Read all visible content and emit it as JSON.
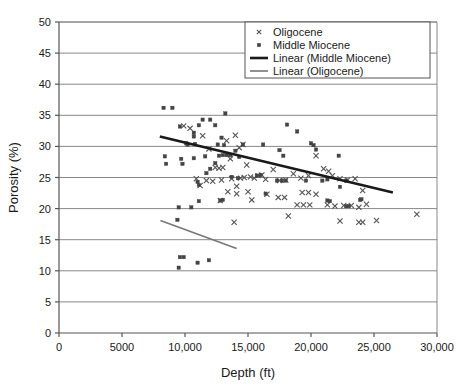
{
  "chart_data": {
    "type": "scatter",
    "title": "",
    "xlabel": "Depth (ft)",
    "ylabel": "Porosity (%)",
    "xlim": [
      0,
      30000
    ],
    "ylim": [
      0,
      50
    ],
    "xticks": [
      0,
      5000,
      10000,
      15000,
      20000,
      25000,
      30000
    ],
    "xtick_labels": [
      "0",
      "5000",
      "10,000",
      "15,000",
      "20,000",
      "25,000",
      "30,000"
    ],
    "yticks": [
      0,
      5,
      10,
      15,
      20,
      25,
      30,
      35,
      40,
      45,
      50
    ],
    "ytick_labels": [
      "0",
      "5",
      "10",
      "15",
      "20",
      "25",
      "30",
      "35",
      "40",
      "45",
      "50"
    ],
    "grid": "horizontal",
    "legend_position": "top-right",
    "series": [
      {
        "name": "Oligocene",
        "marker": "x",
        "color": "#555555",
        "points": [
          [
            9900,
            33.3
          ],
          [
            10400,
            32.9
          ],
          [
            11400,
            31.7
          ],
          [
            11900,
            29.6
          ],
          [
            12400,
            26.6
          ],
          [
            12700,
            26.5
          ],
          [
            13000,
            26.6
          ],
          [
            13300,
            30.9
          ],
          [
            13600,
            28.0
          ],
          [
            14000,
            31.8
          ],
          [
            14300,
            29.8
          ],
          [
            14600,
            30.3
          ],
          [
            14900,
            27.0
          ],
          [
            15200,
            25.1
          ],
          [
            15500,
            24.9
          ],
          [
            15800,
            25.3
          ],
          [
            16100,
            25.4
          ],
          [
            16400,
            24.7
          ],
          [
            13700,
            24.8
          ],
          [
            12900,
            24.6
          ],
          [
            12200,
            24.4
          ],
          [
            11700,
            24.5
          ],
          [
            11200,
            23.7
          ],
          [
            10900,
            24.8
          ],
          [
            14100,
            23.6
          ],
          [
            14400,
            24.9
          ],
          [
            14700,
            25.0
          ],
          [
            15000,
            22.7
          ],
          [
            17000,
            26.3
          ],
          [
            17500,
            24.5
          ],
          [
            18000,
            24.6
          ],
          [
            18600,
            25.6
          ],
          [
            19200,
            24.9
          ],
          [
            19800,
            25.3
          ],
          [
            20400,
            28.5
          ],
          [
            21000,
            26.4
          ],
          [
            21400,
            26.0
          ],
          [
            21700,
            25.3
          ],
          [
            22300,
            24.8
          ],
          [
            22900,
            24.6
          ],
          [
            23500,
            24.8
          ],
          [
            24100,
            22.9
          ],
          [
            17400,
            21.8
          ],
          [
            17900,
            21.8
          ],
          [
            18900,
            20.6
          ],
          [
            19400,
            20.6
          ],
          [
            19900,
            20.6
          ],
          [
            21300,
            20.6
          ],
          [
            21900,
            20.4
          ],
          [
            22600,
            20.5
          ],
          [
            23200,
            20.5
          ],
          [
            23800,
            20.2
          ],
          [
            24400,
            20.7
          ],
          [
            18200,
            18.8
          ],
          [
            22300,
            18.0
          ],
          [
            23800,
            17.8
          ],
          [
            24100,
            17.8
          ],
          [
            25200,
            18.1
          ],
          [
            28400,
            19.1
          ],
          [
            13900,
            17.8
          ],
          [
            19300,
            22.6
          ],
          [
            19800,
            22.6
          ],
          [
            20400,
            22.3
          ],
          [
            13400,
            22.7
          ],
          [
            14100,
            22.4
          ],
          [
            15300,
            21.4
          ],
          [
            16500,
            22.3
          ],
          [
            12800,
            21.3
          ]
        ]
      },
      {
        "name": "Middle Miocene",
        "marker": "square",
        "color": "#444444",
        "points": [
          [
            8300,
            36.2
          ],
          [
            9000,
            36.2
          ],
          [
            13200,
            35.3
          ],
          [
            11400,
            34.3
          ],
          [
            12000,
            34.3
          ],
          [
            12400,
            33.4
          ],
          [
            11100,
            33.4
          ],
          [
            9600,
            33.2
          ],
          [
            10700,
            32.2
          ],
          [
            10700,
            31.6
          ],
          [
            12900,
            31.4
          ],
          [
            10100,
            30.5
          ],
          [
            10200,
            30.3
          ],
          [
            10800,
            30.4
          ],
          [
            12600,
            30.3
          ],
          [
            13100,
            30.2
          ],
          [
            14600,
            30.3
          ],
          [
            16200,
            30.3
          ],
          [
            20000,
            30.5
          ],
          [
            20200,
            30.2
          ],
          [
            20400,
            29.5
          ],
          [
            17500,
            29.4
          ],
          [
            18900,
            32.4
          ],
          [
            18100,
            33.5
          ],
          [
            8400,
            28.4
          ],
          [
            8500,
            27.2
          ],
          [
            9800,
            27.2
          ],
          [
            9700,
            28.0
          ],
          [
            10700,
            28.1
          ],
          [
            11600,
            28.4
          ],
          [
            12400,
            27.3
          ],
          [
            12700,
            28.5
          ],
          [
            13000,
            28.6
          ],
          [
            13300,
            28.6
          ],
          [
            13600,
            28.6
          ],
          [
            14000,
            29.3
          ],
          [
            14300,
            28.3
          ],
          [
            17800,
            28.5
          ],
          [
            22200,
            28.5
          ],
          [
            11000,
            24.3
          ],
          [
            11100,
            23.8
          ],
          [
            11700,
            25.7
          ],
          [
            12000,
            26.4
          ],
          [
            13700,
            25.1
          ],
          [
            14200,
            24.9
          ],
          [
            15700,
            25.3
          ],
          [
            16000,
            25.4
          ],
          [
            17300,
            24.5
          ],
          [
            17700,
            24.5
          ],
          [
            18000,
            24.5
          ],
          [
            19600,
            24.5
          ],
          [
            20900,
            24.5
          ],
          [
            21300,
            24.7
          ],
          [
            22300,
            23.5
          ],
          [
            22800,
            24.5
          ],
          [
            12800,
            21.3
          ],
          [
            13000,
            21.4
          ],
          [
            16400,
            22.4
          ],
          [
            21300,
            21.3
          ],
          [
            21500,
            21.2
          ],
          [
            22800,
            20.4
          ],
          [
            23000,
            20.4
          ],
          [
            23900,
            21.4
          ],
          [
            24000,
            21.5
          ],
          [
            9500,
            20.2
          ],
          [
            10500,
            20.2
          ],
          [
            11100,
            21.2
          ],
          [
            9400,
            18.2
          ],
          [
            9600,
            12.2
          ],
          [
            9900,
            12.2
          ],
          [
            9500,
            10.5
          ],
          [
            11000,
            11.3
          ],
          [
            11900,
            11.7
          ]
        ]
      }
    ],
    "trendlines": [
      {
        "name": "Linear (Middle Miocene)",
        "color": "#1a1a1a",
        "width": 2.6,
        "x0": 8000,
        "y0": 31.6,
        "x1": 26500,
        "y1": 22.6
      },
      {
        "name": "Linear (Oligocene)",
        "color": "#777777",
        "width": 1.6,
        "x0": 8050,
        "y0": 18.1,
        "x1": 14100,
        "y1": 13.6
      }
    ],
    "legend": [
      {
        "label": "Oligocene",
        "type": "marker",
        "marker": "x",
        "color": "#555555"
      },
      {
        "label": "Middle Miocene",
        "type": "marker",
        "marker": "square",
        "color": "#444444"
      },
      {
        "label": "Linear (Middle Miocene)",
        "type": "line",
        "color": "#1a1a1a",
        "width": 2.6
      },
      {
        "label": "Linear (Oligocene)",
        "type": "line",
        "color": "#777777",
        "width": 1.6
      }
    ]
  },
  "style": {
    "gridline_color": "#888888",
    "axis_color": "#555555",
    "background": "#ffffff",
    "legend_border": "#555555"
  }
}
